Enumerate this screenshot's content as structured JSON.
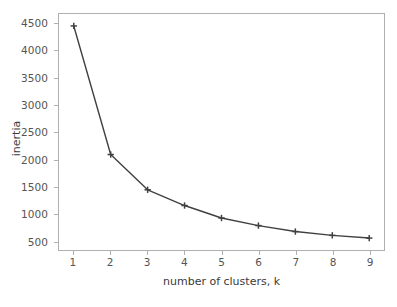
{
  "chart_data": {
    "type": "line",
    "title": "",
    "xlabel": "number of clusters, k",
    "ylabel": "inertia",
    "x": [
      1,
      2,
      3,
      4,
      5,
      6,
      7,
      8,
      9
    ],
    "values": [
      4460,
      2090,
      1440,
      1150,
      920,
      780,
      670,
      600,
      550
    ],
    "series": [
      {
        "name": "inertia",
        "values": [
          4460,
          2090,
          1440,
          1150,
          920,
          780,
          670,
          600,
          550
        ]
      }
    ],
    "xlim": [
      0.6,
      9.4
    ],
    "ylim": [
      330,
      4680
    ],
    "xticks": [
      1,
      2,
      3,
      4,
      5,
      6,
      7,
      8,
      9
    ],
    "xtick_labels": [
      "1",
      "2",
      "3",
      "4",
      "5",
      "6",
      "7",
      "8",
      "9"
    ],
    "yticks": [
      500,
      1000,
      1500,
      2000,
      2500,
      3000,
      3500,
      4000,
      4500
    ],
    "ytick_labels": [
      "500",
      "1000",
      "1500",
      "2000",
      "2500",
      "3000",
      "3500",
      "4000",
      "4500"
    ],
    "grid": false,
    "legend": false,
    "marker": "+",
    "line_color": "#404040",
    "marker_color": "#404040",
    "background_color": "#ffffff",
    "axes_color": "#b0b0b0",
    "tick_label_color": "#555555"
  }
}
